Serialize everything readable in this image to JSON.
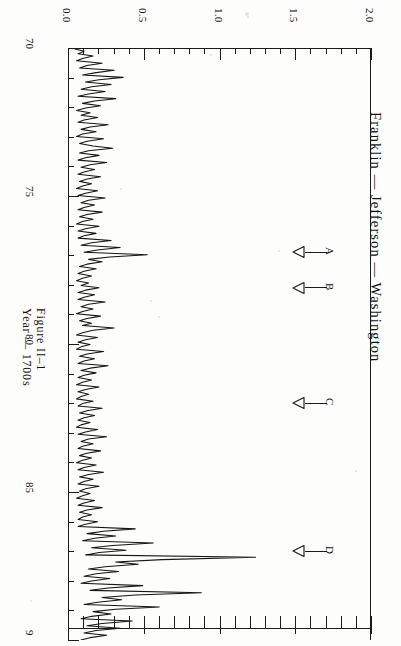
{
  "figure": {
    "title": "Franklin  —  Jefferson  —  Washington",
    "axis_title": "Year  —  1700s",
    "caption": "Figure II–1"
  },
  "annotations": [
    {
      "letter": "A",
      "year": 76.9
    },
    {
      "letter": "B",
      "year": 78.1
    },
    {
      "letter": "C",
      "year": 82.0
    },
    {
      "letter": "D",
      "year": 87.0
    }
  ],
  "chart_data": {
    "type": "line",
    "title": "Franklin  —  Jefferson  —  Washington",
    "xlabel": "Year — 1700s",
    "ylabel": "",
    "orientation": "rotated-90-clockwise",
    "grid": false,
    "legend": "none",
    "xlim": [
      70,
      90
    ],
    "ylim": [
      0.0,
      2.0
    ],
    "x_tick_labels": [
      "70",
      "75",
      "80",
      "85",
      "9"
    ],
    "x_ticks": [
      70,
      75,
      80,
      85,
      90
    ],
    "x_minor_tick_step": 1,
    "y_tick_labels": [
      "0.0",
      "0.5",
      "1.0",
      "1.5",
      "2.0"
    ],
    "y_ticks": [
      0.0,
      0.5,
      1.0,
      1.5,
      2.0
    ],
    "y_minor_tick_step": 0.1,
    "annotation_letters": [
      "A",
      "B",
      "C",
      "D"
    ],
    "x": [
      70.0,
      70.08,
      70.16,
      70.24,
      70.32,
      70.4,
      70.48,
      70.56,
      70.64,
      70.72,
      70.8,
      70.88,
      70.96,
      71.04,
      71.12,
      71.2,
      71.28,
      71.36,
      71.44,
      71.52,
      71.6,
      71.68,
      71.76,
      71.84,
      71.92,
      72.0,
      72.08,
      72.16,
      72.24,
      72.32,
      72.4,
      72.48,
      72.56,
      72.64,
      72.72,
      72.8,
      72.88,
      72.96,
      73.04,
      73.12,
      73.2,
      73.28,
      73.36,
      73.44,
      73.52,
      73.6,
      73.68,
      73.76,
      73.84,
      73.92,
      74.0,
      74.08,
      74.16,
      74.24,
      74.32,
      74.4,
      74.48,
      74.56,
      74.64,
      74.72,
      74.8,
      74.88,
      74.96,
      75.04,
      75.12,
      75.2,
      75.28,
      75.36,
      75.44,
      75.52,
      75.6,
      75.68,
      75.76,
      75.84,
      75.92,
      76.0,
      76.08,
      76.16,
      76.24,
      76.32,
      76.4,
      76.48,
      76.56,
      76.64,
      76.72,
      76.8,
      76.88,
      76.96,
      77.04,
      77.12,
      77.2,
      77.28,
      77.36,
      77.44,
      77.52,
      77.6,
      77.68,
      77.76,
      77.84,
      77.92,
      78.0,
      78.08,
      78.16,
      78.24,
      78.32,
      78.4,
      78.48,
      78.56,
      78.64,
      78.72,
      78.8,
      78.88,
      78.96,
      79.04,
      79.12,
      79.2,
      79.28,
      79.36,
      79.44,
      79.52,
      79.6,
      79.68,
      79.76,
      79.84,
      79.92,
      80.0,
      80.08,
      80.16,
      80.24,
      80.32,
      80.4,
      80.48,
      80.56,
      80.64,
      80.72,
      80.8,
      80.88,
      80.96,
      81.04,
      81.12,
      81.2,
      81.28,
      81.36,
      81.44,
      81.52,
      81.6,
      81.68,
      81.76,
      81.84,
      81.92,
      82.0,
      82.08,
      82.16,
      82.24,
      82.32,
      82.4,
      82.48,
      82.56,
      82.64,
      82.72,
      82.8,
      82.88,
      82.96,
      83.04,
      83.12,
      83.2,
      83.28,
      83.36,
      83.44,
      83.52,
      83.6,
      83.68,
      83.76,
      83.84,
      83.92,
      84.0,
      84.08,
      84.16,
      84.24,
      84.32,
      84.4,
      84.48,
      84.56,
      84.64,
      84.72,
      84.8,
      84.88,
      84.96,
      85.04,
      85.12,
      85.2,
      85.28,
      85.36,
      85.44,
      85.52,
      85.6,
      85.68,
      85.76,
      85.84,
      85.92,
      86.0,
      86.08,
      86.16,
      86.24,
      86.32,
      86.4,
      86.48,
      86.56,
      86.64,
      86.72,
      86.8,
      86.88,
      86.96,
      87.04,
      87.12,
      87.2,
      87.28,
      87.36,
      87.44,
      87.52,
      87.6,
      87.68,
      87.76,
      87.84,
      87.92,
      88.0,
      88.08,
      88.16,
      88.24,
      88.32,
      88.4,
      88.48,
      88.56,
      88.64,
      88.72,
      88.8,
      88.88,
      88.96,
      89.04,
      89.12,
      89.2,
      89.28,
      89.36,
      89.44,
      89.52,
      89.6,
      89.68,
      89.76,
      89.84,
      89.92,
      90.0
    ],
    "y": [
      0.04,
      0.1,
      0.06,
      0.16,
      0.09,
      0.05,
      0.22,
      0.12,
      0.07,
      0.3,
      0.18,
      0.09,
      0.36,
      0.2,
      0.11,
      0.28,
      0.15,
      0.08,
      0.24,
      0.13,
      0.06,
      0.31,
      0.17,
      0.09,
      0.21,
      0.11,
      0.05,
      0.14,
      0.08,
      0.19,
      0.1,
      0.06,
      0.26,
      0.14,
      0.08,
      0.18,
      0.09,
      0.05,
      0.23,
      0.12,
      0.07,
      0.16,
      0.29,
      0.13,
      0.07,
      0.2,
      0.11,
      0.06,
      0.25,
      0.14,
      0.08,
      0.17,
      0.1,
      0.06,
      0.21,
      0.12,
      0.07,
      0.15,
      0.09,
      0.05,
      0.19,
      0.11,
      0.06,
      0.24,
      0.13,
      0.08,
      0.17,
      0.1,
      0.06,
      0.22,
      0.12,
      0.07,
      0.16,
      0.09,
      0.05,
      0.2,
      0.11,
      0.06,
      0.18,
      0.1,
      0.06,
      0.28,
      0.15,
      0.08,
      0.34,
      0.19,
      0.1,
      0.52,
      0.27,
      0.13,
      0.22,
      0.12,
      0.07,
      0.18,
      0.1,
      0.06,
      0.15,
      0.09,
      0.05,
      0.13,
      0.08,
      0.2,
      0.11,
      0.06,
      0.17,
      0.1,
      0.06,
      0.24,
      0.13,
      0.08,
      0.16,
      0.09,
      0.05,
      0.21,
      0.12,
      0.07,
      0.15,
      0.09,
      0.3,
      0.16,
      0.09,
      0.05,
      0.19,
      0.11,
      0.06,
      0.14,
      0.08,
      0.05,
      0.23,
      0.12,
      0.07,
      0.17,
      0.1,
      0.06,
      0.26,
      0.14,
      0.08,
      0.18,
      0.1,
      0.06,
      0.15,
      0.09,
      0.05,
      0.2,
      0.11,
      0.06,
      0.13,
      0.08,
      0.05,
      0.16,
      0.09,
      0.06,
      0.22,
      0.12,
      0.07,
      0.17,
      0.1,
      0.06,
      0.14,
      0.08,
      0.05,
      0.19,
      0.11,
      0.06,
      0.25,
      0.13,
      0.08,
      0.16,
      0.09,
      0.06,
      0.21,
      0.12,
      0.07,
      0.15,
      0.09,
      0.05,
      0.18,
      0.1,
      0.06,
      0.23,
      0.13,
      0.07,
      0.16,
      0.1,
      0.06,
      0.2,
      0.11,
      0.07,
      0.14,
      0.09,
      0.05,
      0.17,
      0.1,
      0.06,
      0.22,
      0.12,
      0.07,
      0.15,
      0.09,
      0.06,
      0.19,
      0.11,
      0.06,
      0.44,
      0.23,
      0.12,
      0.31,
      0.17,
      0.09,
      0.56,
      0.29,
      0.15,
      0.38,
      0.2,
      0.11,
      1.24,
      0.62,
      0.31,
      0.46,
      0.24,
      0.13,
      0.33,
      0.18,
      0.1,
      0.27,
      0.15,
      0.08,
      0.49,
      0.26,
      0.14,
      0.88,
      0.44,
      0.22,
      0.35,
      0.19,
      0.1,
      0.6,
      0.31,
      0.16,
      0.28,
      0.15,
      0.08,
      0.42,
      0.22,
      0.12,
      0.34,
      0.18,
      0.1,
      0.25,
      0.14,
      0.08
    ]
  }
}
